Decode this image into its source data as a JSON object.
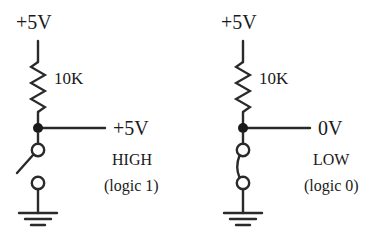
{
  "figure": {
    "background_color": "#ffffff",
    "line_color": "#2a2a2a",
    "text_color": "#1a1a1a"
  },
  "circuits": [
    {
      "id": "high",
      "supply_label": "+5V",
      "resistor_label": "10K",
      "output_label": "+5V",
      "state_label": "HIGH",
      "logic_label": "(logic 1)",
      "switch_state": "open",
      "ground_symbol": "earth-ground"
    },
    {
      "id": "low",
      "supply_label": "+5V",
      "resistor_label": "10K",
      "output_label": "0V",
      "state_label": "LOW",
      "logic_label": "(logic 0)",
      "switch_state": "closed",
      "ground_symbol": "earth-ground"
    }
  ]
}
